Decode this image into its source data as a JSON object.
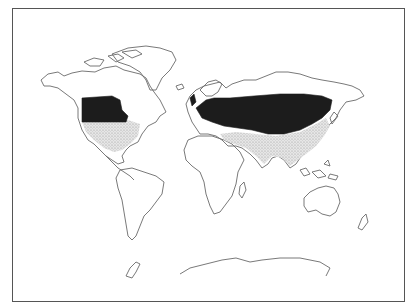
{
  "figure": {
    "type": "world-distribution-map",
    "title_visible": false,
    "legend_visible": false
  },
  "map": {
    "projection": "world outline (Robinson-like)",
    "shading": [
      {
        "name": "dense-range",
        "color": "#1c1c1c",
        "regions": [
          "northern-central North America",
          "Europe",
          "temperate Asia (Central Asia to northern China)"
        ]
      },
      {
        "name": "sparse-range",
        "color": "#c8c8c8",
        "pattern": "stipple",
        "regions": [
          "central/southern United States",
          "Mediterranean rim",
          "southern and eastern Asia (Indian subcontinent, China, Korea)"
        ]
      }
    ],
    "continents": [
      "North America",
      "Greenland",
      "South America",
      "Europe",
      "Africa",
      "Asia",
      "Australia",
      "New Zealand",
      "Antarctica"
    ]
  }
}
